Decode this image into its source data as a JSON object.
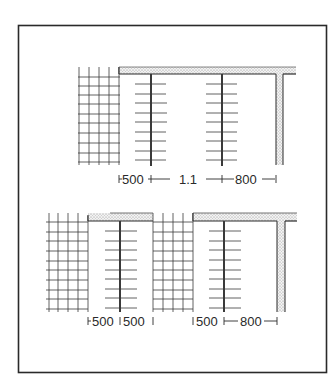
{
  "figure": {
    "colors": {
      "ink": "#2a2a2a",
      "slab_fill": "#e4e4e4",
      "background": "#ffffff"
    }
  },
  "top_diagram": {
    "dimensions": [
      {
        "id": "d1",
        "label": "500"
      },
      {
        "id": "d2",
        "label": "1.1"
      },
      {
        "id": "d3",
        "label": "800"
      }
    ]
  },
  "bottom_diagram": {
    "dimensions": [
      {
        "id": "d1",
        "label": "500"
      },
      {
        "id": "d2",
        "label": "500"
      },
      {
        "id": "d3",
        "label": "500"
      },
      {
        "id": "d4",
        "label": "800"
      }
    ]
  }
}
